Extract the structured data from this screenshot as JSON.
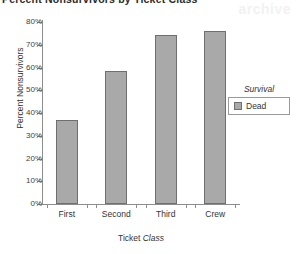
{
  "title": "Percent Nonsurvivors by Ticket Class",
  "watermark": "archive",
  "chart_data": {
    "type": "bar",
    "title": "Percent Nonsurvivors by Ticket Class",
    "categories": [
      "First",
      "Second",
      "Third",
      "Crew"
    ],
    "values": [
      37,
      58.5,
      74.5,
      76
    ],
    "xlabel_plain": "Ticket ",
    "xlabel_em": "Class",
    "ylabel": "Percent Nonsurvivors",
    "ylim": [
      0,
      80
    ],
    "ytick_labels": [
      "0%",
      "10%",
      "20%",
      "30%",
      "40%",
      "50%",
      "60%",
      "70%",
      "80%"
    ],
    "ytick_values": [
      0,
      10,
      20,
      30,
      40,
      50,
      60,
      70,
      80
    ],
    "grid": false,
    "legend_position": "right",
    "legend": {
      "title": "Survival",
      "entries": [
        {
          "label": "Dead",
          "color": "#a9a9a9"
        }
      ]
    },
    "bar_color": "#a9a9a9",
    "bar_border_color": "#6f6f6f"
  }
}
